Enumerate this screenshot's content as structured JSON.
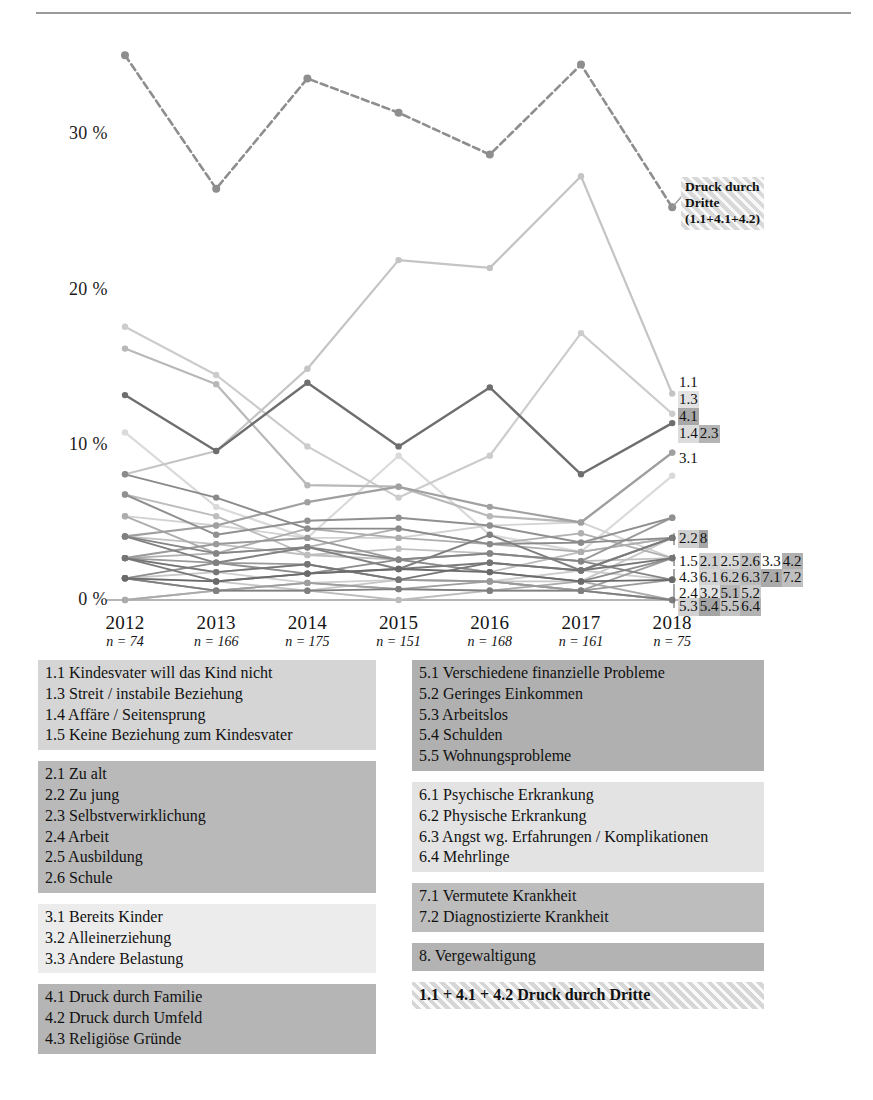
{
  "page": {
    "folio": ""
  },
  "chart_data": {
    "type": "line",
    "title": "",
    "xlabel": "",
    "ylabel": "",
    "grid": false,
    "legend_position": "right-inline",
    "x": [
      "2012",
      "2013",
      "2014",
      "2015",
      "2016",
      "2017",
      "2018"
    ],
    "x_sublabels": [
      "n = 74",
      "n = 166",
      "n = 175",
      "n = 151",
      "n = 168",
      "n = 161",
      "n = 75"
    ],
    "ylim": [
      0,
      36
    ],
    "ytick_labels": [
      "0 %",
      "10 %",
      "20 %",
      "30 %"
    ],
    "ytick_values": [
      0,
      10,
      20,
      30
    ],
    "series": [
      {
        "name": "1.1 + 4.1 + 4.2 Druck durch Dritte",
        "key": "druck",
        "values": [
          35.1,
          26.5,
          33.6,
          31.4,
          28.7,
          34.5,
          25.3
        ],
        "color": "#8e8e8e",
        "width": 2.6,
        "dashed": true
      },
      {
        "name": "1.1",
        "key": "1.1",
        "values": [
          8.1,
          9.6,
          14.9,
          21.9,
          21.4,
          27.3,
          13.3
        ],
        "color": "#c4c4c4",
        "width": 2.2,
        "dashed": false
      },
      {
        "name": "1.3",
        "key": "1.3",
        "values": [
          17.6,
          14.5,
          9.9,
          6.6,
          9.3,
          17.2,
          12.0
        ],
        "color": "#cccccc",
        "width": 2.2,
        "dashed": false
      },
      {
        "name": "4.1",
        "key": "4.1",
        "values": [
          13.2,
          9.6,
          14.0,
          9.9,
          13.7,
          8.1,
          11.4
        ],
        "color": "#6e6e6e",
        "width": 2.4,
        "dashed": false
      },
      {
        "name": "1.4",
        "key": "1.4",
        "values": [
          16.2,
          13.9,
          7.4,
          7.3,
          5.4,
          5.0,
          9.5
        ],
        "color": "#b8b8b8",
        "width": 2.2,
        "dashed": false
      },
      {
        "name": "2.3",
        "key": "2.3",
        "values": [
          4.1,
          4.8,
          6.3,
          7.3,
          6.0,
          5.0,
          9.5
        ],
        "color": "#a0a0a0",
        "width": 2.2,
        "dashed": false
      },
      {
        "name": "3.1",
        "key": "3.1",
        "values": [
          10.8,
          6.0,
          4.0,
          9.3,
          4.2,
          3.1,
          8.0
        ],
        "color": "#dadada",
        "width": 2.2,
        "dashed": false
      },
      {
        "name": "2.2",
        "key": "2.2",
        "values": [
          6.8,
          4.2,
          5.1,
          5.3,
          4.8,
          3.7,
          5.3
        ],
        "color": "#909090",
        "width": 2.0,
        "dashed": false
      },
      {
        "name": "8.",
        "key": "8",
        "values": [
          2.7,
          3.6,
          4.0,
          2.6,
          3.0,
          2.5,
          5.3
        ],
        "color": "#9a9a9a",
        "width": 2.0,
        "dashed": false
      },
      {
        "name": "1.5",
        "key": "1.5",
        "values": [
          5.4,
          3.0,
          4.6,
          4.0,
          3.6,
          3.1,
          4.0
        ],
        "color": "#adadad",
        "width": 1.9,
        "dashed": false
      },
      {
        "name": "2.1",
        "key": "2.1",
        "values": [
          4.1,
          2.4,
          3.4,
          2.0,
          4.2,
          1.9,
          4.0
        ],
        "color": "#808080",
        "width": 1.9,
        "dashed": false
      },
      {
        "name": "2.5",
        "key": "2.5",
        "values": [
          6.8,
          5.4,
          2.9,
          2.6,
          1.8,
          3.1,
          4.0
        ],
        "color": "#bdbdbd",
        "width": 1.9,
        "dashed": false
      },
      {
        "name": "2.6",
        "key": "2.6",
        "values": [
          1.4,
          1.8,
          2.3,
          1.3,
          1.2,
          1.2,
          4.0
        ],
        "color": "#c8c8c8",
        "width": 1.9,
        "dashed": false
      },
      {
        "name": "3.3",
        "key": "3.3",
        "values": [
          2.7,
          1.2,
          1.7,
          2.0,
          2.4,
          1.9,
          4.0
        ],
        "color": "#7a7a7a",
        "width": 1.9,
        "dashed": false
      },
      {
        "name": "4.2",
        "key": "4.2",
        "values": [
          8.1,
          6.6,
          4.6,
          4.6,
          3.6,
          3.7,
          4.0
        ],
        "color": "#8a8a8a",
        "width": 1.9,
        "dashed": false
      },
      {
        "name": "4.3",
        "key": "4.3",
        "values": [
          1.4,
          0.6,
          1.1,
          0.7,
          1.2,
          0.6,
          2.7
        ],
        "color": "#9e9e9e",
        "width": 1.8,
        "dashed": false
      },
      {
        "name": "6.1",
        "key": "6.1",
        "values": [
          5.4,
          4.8,
          4.0,
          4.0,
          4.8,
          5.0,
          2.7
        ],
        "color": "#d2d2d2",
        "width": 1.8,
        "dashed": false
      },
      {
        "name": "6.2",
        "key": "6.2",
        "values": [
          4.1,
          3.6,
          2.9,
          3.3,
          3.0,
          2.5,
          2.7
        ],
        "color": "#c0c0c0",
        "width": 1.8,
        "dashed": false
      },
      {
        "name": "6.3",
        "key": "6.3",
        "values": [
          2.7,
          3.0,
          3.4,
          4.6,
          3.6,
          4.3,
          2.7
        ],
        "color": "#b0b0b0",
        "width": 1.8,
        "dashed": false
      },
      {
        "name": "7.1",
        "key": "7.1",
        "values": [
          1.4,
          2.4,
          1.7,
          2.6,
          1.8,
          1.2,
          2.7
        ],
        "color": "#8c8c8c",
        "width": 1.8,
        "dashed": false
      },
      {
        "name": "7.2",
        "key": "7.2",
        "values": [
          2.7,
          1.8,
          2.3,
          1.3,
          2.4,
          1.9,
          2.7
        ],
        "color": "#757575",
        "width": 1.8,
        "dashed": false
      },
      {
        "name": "2.4",
        "key": "2.4",
        "values": [
          4.1,
          3.0,
          3.4,
          2.6,
          3.0,
          2.5,
          1.3
        ],
        "color": "#858585",
        "width": 1.8,
        "dashed": false
      },
      {
        "name": "3.2",
        "key": "3.2",
        "values": [
          2.7,
          1.8,
          1.1,
          1.3,
          1.2,
          1.9,
          1.3
        ],
        "color": "#cfcfcf",
        "width": 1.8,
        "dashed": false
      },
      {
        "name": "5.1",
        "key": "5.1",
        "values": [
          1.4,
          1.2,
          1.7,
          2.0,
          1.8,
          1.2,
          1.3
        ],
        "color": "#6a6a6a",
        "width": 1.8,
        "dashed": false
      },
      {
        "name": "5.2",
        "key": "5.2",
        "values": [
          2.7,
          2.4,
          2.3,
          1.3,
          1.2,
          0.6,
          1.3
        ],
        "color": "#999999",
        "width": 1.8,
        "dashed": false
      },
      {
        "name": "5.3",
        "key": "5.3",
        "values": [
          1.4,
          0.6,
          0.6,
          0.7,
          0.6,
          0.6,
          0.0
        ],
        "color": "#7f7f7f",
        "width": 1.8,
        "dashed": false
      },
      {
        "name": "5.4",
        "key": "5.4",
        "values": [
          0.0,
          0.6,
          1.1,
          0.7,
          0.6,
          1.2,
          0.0
        ],
        "color": "#aaaaaa",
        "width": 1.8,
        "dashed": false
      },
      {
        "name": "5.5",
        "key": "5.5",
        "values": [
          1.4,
          1.2,
          0.6,
          1.3,
          1.2,
          0.6,
          0.0
        ],
        "color": "#c6c6c6",
        "width": 1.8,
        "dashed": false
      },
      {
        "name": "6.4",
        "key": "6.4",
        "values": [
          0.0,
          0.6,
          0.6,
          0.0,
          0.6,
          0.6,
          0.0
        ],
        "color": "#bbbbbb",
        "width": 1.8,
        "dashed": false
      }
    ],
    "inline_tag_rows": [
      {
        "tags": [
          {
            "label": "1.1",
            "shade": "#ffffff"
          }
        ]
      },
      {
        "tags": [
          {
            "label": "1.3",
            "shade": "#e2e2e2"
          }
        ]
      },
      {
        "tags": [
          {
            "label": "4.1",
            "shade": "#a8a8a8"
          }
        ]
      },
      {
        "tags": [
          {
            "label": "1.4",
            "shade": "#dcdcdc"
          },
          {
            "label": "2.3",
            "shade": "#b4b4b4"
          }
        ]
      },
      {
        "tags": [
          {
            "label": "3.1",
            "shade": "#ffffff"
          }
        ]
      },
      {
        "tags": [
          {
            "label": "2.2",
            "shade": "#d0d0d0"
          },
          {
            "label": "8",
            "shade": "#a6a6a6"
          }
        ]
      },
      {
        "tags": [
          {
            "label": "1.5",
            "shade": "#ffffff"
          },
          {
            "label": "2.1",
            "shade": "#cfcfcf"
          },
          {
            "label": "2.5",
            "shade": "#d8d8d8"
          },
          {
            "label": "2.6",
            "shade": "#c2c2c2"
          },
          {
            "label": "3.3",
            "shade": "#ffffff"
          },
          {
            "label": "4.2",
            "shade": "#b0b0b0"
          }
        ]
      },
      {
        "tags": [
          {
            "label": "4.3",
            "shade": "#ffffff"
          },
          {
            "label": "6.1",
            "shade": "#d4d4d4"
          },
          {
            "label": "6.2",
            "shade": "#c8c8c8"
          },
          {
            "label": "6.3",
            "shade": "#bcbcbc"
          },
          {
            "label": "7.1",
            "shade": "#aaaaaa"
          },
          {
            "label": "7.2",
            "shade": "#bfbfbf"
          }
        ]
      },
      {
        "tags": [
          {
            "label": "2.4",
            "shade": "#ffffff"
          },
          {
            "label": "3.2",
            "shade": "#e0e0e0"
          },
          {
            "label": "5.1",
            "shade": "#b6b6b6"
          },
          {
            "label": "5.2",
            "shade": "#cacaca"
          }
        ]
      },
      {
        "tags": [
          {
            "label": "5.3",
            "shade": "#d2d2d2"
          },
          {
            "label": "5.4",
            "shade": "#a4a4a4"
          },
          {
            "label": "5.5",
            "shade": "#c4c4c4"
          },
          {
            "label": "6.4",
            "shade": "#b2b2b2"
          }
        ]
      }
    ],
    "callout": {
      "line1": "Druck durch",
      "line2": "Dritte",
      "line3": "(1.1+4.1+4.2)"
    }
  },
  "legend": {
    "left_blocks": [
      {
        "shade": "#d5d5d5",
        "lines": [
          "1.1 Kindesvater will das Kind nicht",
          "1.3 Streit / instabile Beziehung",
          "1.4 Affäre / Seitensprung",
          "1.5 Keine Beziehung zum Kindesvater"
        ]
      },
      {
        "shade": "#b9b9b9",
        "lines": [
          "2.1 Zu alt",
          "2.2 Zu jung",
          "2.3 Selbstverwirklichung",
          "2.4 Arbeit",
          "2.5 Ausbildung",
          "2.6 Schule"
        ]
      },
      {
        "shade": "#ececec",
        "lines": [
          "3.1 Bereits Kinder",
          "3.2 Alleinerziehung",
          "3.3 Andere Belastung"
        ]
      },
      {
        "shade": "#b5b5b5",
        "lines": [
          "4.1 Druck durch Familie",
          "4.2 Druck durch Umfeld",
          "4.3 Religiöse Gründe"
        ]
      }
    ],
    "right_blocks": [
      {
        "shade": "#b0b0b0",
        "lines": [
          "5.1 Verschiedene finanzielle Probleme",
          "5.2 Geringes Einkommen",
          "5.3 Arbeitslos",
          "5.4 Schulden",
          "5.5 Wohnungsprobleme"
        ]
      },
      {
        "shade": "#e3e3e3",
        "lines": [
          "6.1 Psychische Erkrankung",
          "6.2 Physische Erkrankung",
          "6.3 Angst wg. Erfahrungen / Komplikationen",
          "6.4 Mehrlinge"
        ]
      },
      {
        "shade": "#bdbdbd",
        "lines": [
          "7.1 Vermutete Krankheit",
          "7.2 Diagnostizierte Krankheit"
        ]
      },
      {
        "shade": "#b3b3b3",
        "lines": [
          "8. Vergewaltigung"
        ]
      },
      {
        "shade": "hatched",
        "lines": [
          "1.1 + 4.1 + 4.2 Druck durch Dritte"
        ]
      }
    ]
  }
}
